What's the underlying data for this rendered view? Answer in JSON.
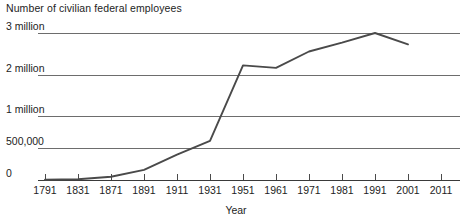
{
  "chart_data": {
    "type": "line",
    "title": "Number of civilian federal employees",
    "xlabel": "Year",
    "ylabel": "",
    "grid": true,
    "legend": false,
    "xlim": [
      1791,
      2011
    ],
    "ylim": [
      0,
      3000000
    ],
    "x_tick_labels": [
      "1791",
      "1831",
      "1871",
      "1891",
      "1911",
      "1931",
      "1951",
      "1961",
      "1971",
      "1981",
      "1991",
      "2001",
      "2011"
    ],
    "x_tick_values": [
      1791,
      1831,
      1871,
      1891,
      1911,
      1931,
      1951,
      1961,
      1971,
      1981,
      1991,
      2001,
      2011
    ],
    "y_tick_labels": [
      "0",
      "500,000",
      "1 million",
      "2 million",
      "3 million"
    ],
    "y_tick_values": [
      0,
      500000,
      1000000,
      2000000,
      3000000
    ],
    "series": [
      {
        "name": "Civilian federal employees",
        "x": [
          1791,
          1831,
          1871,
          1891,
          1911,
          1931,
          1951,
          1961,
          1971,
          1981,
          1991,
          2001
        ],
        "values": [
          5000,
          12000,
          51000,
          158000,
          396000,
          610000,
          2230000,
          2170000,
          2560000,
          2770000,
          3000000,
          2730000
        ]
      }
    ]
  },
  "colors": {
    "line": "#4a4a4a",
    "gridline": "#6d6d6d",
    "axis": "#3a3a3a",
    "text": "#1d1d1d",
    "background": "#ffffff"
  }
}
